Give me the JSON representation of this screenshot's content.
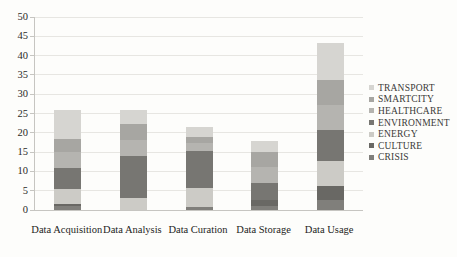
{
  "chart_data": {
    "type": "bar",
    "stacked": true,
    "title": "",
    "xlabel": "",
    "ylabel": "",
    "ylim": [
      0,
      50
    ],
    "ytick_step": 5,
    "yticks": [
      "0",
      "5",
      "10",
      "15",
      "20",
      "25",
      "30",
      "35",
      "40",
      "45",
      "50"
    ],
    "grid": "horizontal",
    "legend_position": "right",
    "categories": [
      "Data Acquisition",
      "Data Analysis",
      "Data Curation",
      "Data Storage",
      "Data Usage"
    ],
    "series_bottom_to_top": [
      {
        "name": "CRISIS",
        "color": "#807f7b",
        "values": [
          1.0,
          0,
          0.8,
          1.0,
          2.5
        ]
      },
      {
        "name": "CULTURE",
        "color": "#696864",
        "values": [
          0.5,
          0,
          0,
          1.5,
          3.6
        ]
      },
      {
        "name": "ENERGY",
        "color": "#cccbc6",
        "values": [
          4.0,
          3.1,
          5.0,
          0,
          6.5
        ]
      },
      {
        "name": "ENVIRONMENT",
        "color": "#777672",
        "values": [
          5.5,
          10.8,
          9.5,
          4.6,
          8.2
        ]
      },
      {
        "name": "HEALTHCARE",
        "color": "#b5b4b0",
        "values": [
          4.0,
          4.3,
          2.0,
          4.0,
          6.5
        ]
      },
      {
        "name": "SMARTCITY",
        "color": "#a7a6a2",
        "values": [
          3.5,
          4.2,
          1.6,
          4.0,
          6.5
        ]
      },
      {
        "name": "TRANSPORT",
        "color": "#d6d5d1",
        "values": [
          7.5,
          3.6,
          2.6,
          2.9,
          9.5
        ]
      }
    ],
    "legend_top_to_bottom": [
      "TRANSPORT",
      "SMARTCITY",
      "HEALTHCARE",
      "ENVIRONMENT",
      "ENERGY",
      "CULTURE",
      "CRISIS"
    ],
    "bar_totals": [
      26.0,
      26.0,
      21.5,
      18.0,
      43.3
    ]
  }
}
